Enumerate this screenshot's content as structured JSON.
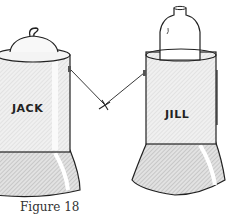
{
  "figure": {
    "caption": "Figure 18",
    "left_can": {
      "label": "JACK",
      "contents": "lid-with-hook"
    },
    "right_can": {
      "label": "JILL",
      "contents": "bottle"
    },
    "string": {
      "knot": "cross-knot"
    }
  },
  "colors": {
    "ink": "#222222",
    "shade": "#c8c8c8",
    "body": "#ececec",
    "background": "#ffffff"
  }
}
